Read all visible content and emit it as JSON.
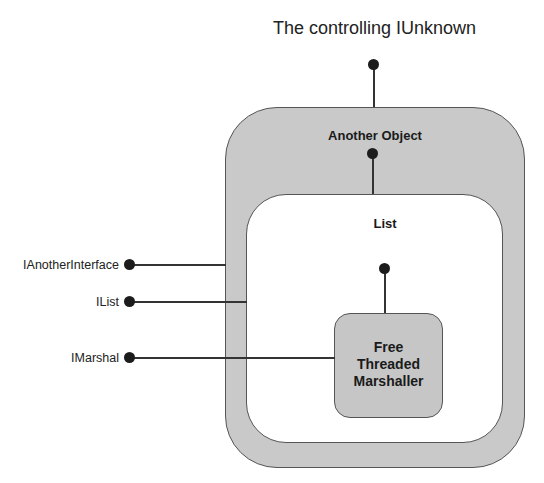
{
  "diagram": {
    "top_label": "The controlling IUnknown",
    "outer_object": {
      "title": "Another Object"
    },
    "inner_object": {
      "title": "List"
    },
    "ftm_object": {
      "title_lines": [
        "Free",
        "Threaded",
        "Marshaller"
      ]
    },
    "interfaces": [
      {
        "label": "IAnotherInterface"
      },
      {
        "label": "IList"
      },
      {
        "label": "IMarshal"
      }
    ],
    "colors": {
      "shaded_fill": "#c9c9c9",
      "white_fill": "#ffffff",
      "line": "#333333",
      "dot": "#1c1c1c"
    }
  }
}
